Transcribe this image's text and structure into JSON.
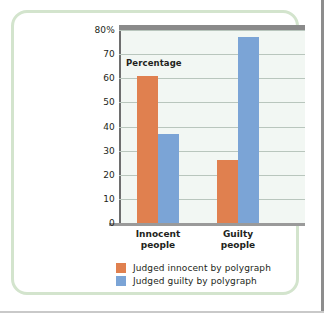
{
  "figure": {
    "frame_color": "#d3e4cd",
    "background": "#ffffff"
  },
  "chart_data": {
    "type": "bar",
    "title": "",
    "xlabel": "",
    "ylabel": "Percentage",
    "ylim": [
      0,
      80
    ],
    "grid": true,
    "legend_position": "bottom",
    "categories": [
      "Innocent people",
      "Guilty people"
    ],
    "category_lines": [
      [
        "Innocent",
        "people"
      ],
      [
        "Guilty",
        "people"
      ]
    ],
    "ytick_labels": [
      "80%",
      "70",
      "60",
      "50",
      "40",
      "30",
      "20",
      "10",
      "0"
    ],
    "ytick_values": [
      80,
      70,
      60,
      50,
      40,
      30,
      20,
      10,
      0
    ],
    "series": [
      {
        "name": "Judged innocent by polygraph",
        "color": "#e0804f",
        "values": [
          61,
          26
        ]
      },
      {
        "name": "Judged guilty by polygraph",
        "color": "#7ba4d6",
        "values": [
          37,
          77
        ]
      }
    ]
  }
}
